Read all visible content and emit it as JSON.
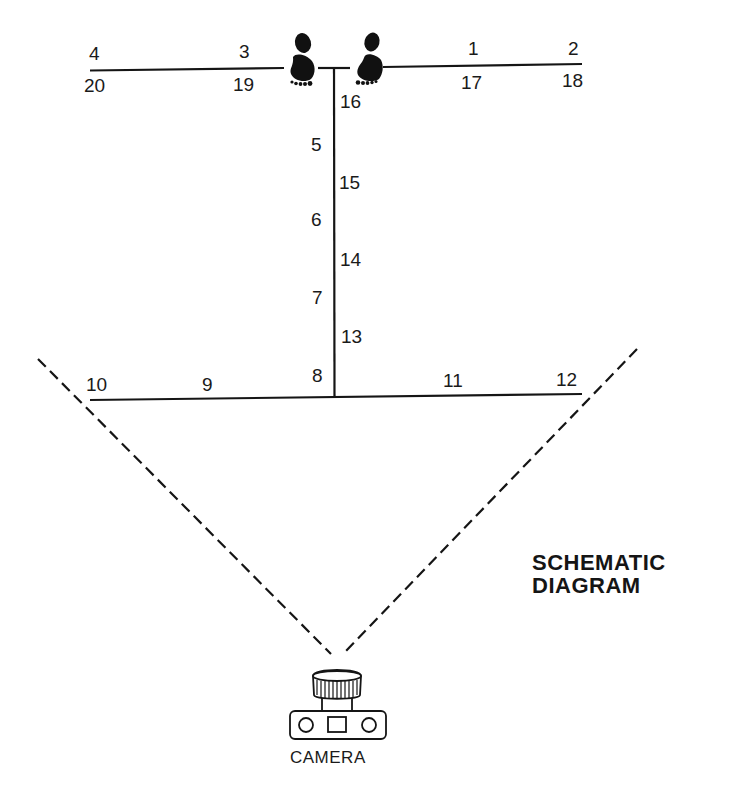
{
  "title": {
    "line1": "SCHEMATIC",
    "line2": "DIAGRAM"
  },
  "camera": {
    "label": "CAMERA",
    "icon": "camera-icon"
  },
  "footprints": [
    {
      "name": "left-footprint",
      "icon": "footprint-icon"
    },
    {
      "name": "right-footprint",
      "icon": "footprint-icon"
    }
  ],
  "positions": {
    "p1": "1",
    "p2": "2",
    "p3": "3",
    "p4": "4",
    "p5": "5",
    "p6": "6",
    "p7": "7",
    "p8": "8",
    "p9": "9",
    "p10": "10",
    "p11": "11",
    "p12": "12",
    "p13": "13",
    "p14": "14",
    "p15": "15",
    "p16": "16",
    "p17": "17",
    "p18": "18",
    "p19": "19",
    "p20": "20"
  },
  "colors": {
    "ink": "#151515",
    "background": "#ffffff"
  }
}
